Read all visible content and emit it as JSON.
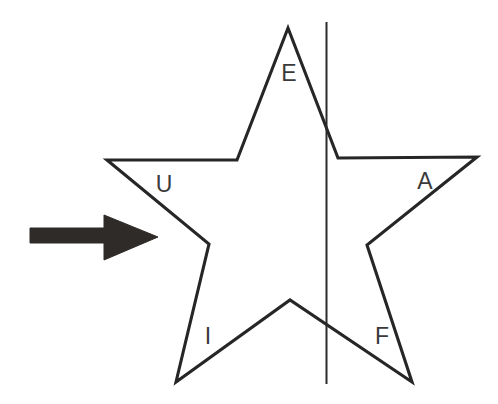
{
  "figure": {
    "background_color": "#ffffff",
    "width": 498,
    "height": 404
  },
  "star": {
    "name": "five-pointed-star",
    "stroke_color": "#262626",
    "fill_color": "#ffffff",
    "stroke_width": 3.1,
    "points_path": "288,28 338,158 477,157 367,245 412,382 290,300 176,382 209,244 107,160 237,160",
    "outer_vertices": [
      {
        "name": "top-point",
        "x": 288,
        "y": 28
      },
      {
        "name": "right-point",
        "x": 477,
        "y": 157
      },
      {
        "name": "bottom-right-point",
        "x": 412,
        "y": 382
      },
      {
        "name": "bottom-left-point",
        "x": 176,
        "y": 382
      },
      {
        "name": "left-point",
        "x": 107,
        "y": 160
      }
    ],
    "inner_vertices": [
      {
        "name": "upper-right-notch",
        "x": 338,
        "y": 158
      },
      {
        "name": "right-notch",
        "x": 367,
        "y": 245
      },
      {
        "name": "bottom-notch",
        "x": 290,
        "y": 300
      },
      {
        "name": "left-notch",
        "x": 209,
        "y": 244
      },
      {
        "name": "upper-left-notch",
        "x": 237,
        "y": 160
      }
    ]
  },
  "labels": [
    {
      "id": "label-e",
      "text": "E",
      "x": 289,
      "y": 81,
      "name": "star-label-e"
    },
    {
      "id": "label-u",
      "text": "U",
      "x": 164,
      "y": 192,
      "name": "star-label-u"
    },
    {
      "id": "label-a",
      "text": "A",
      "x": 425,
      "y": 189,
      "name": "star-label-a"
    },
    {
      "id": "label-i",
      "text": "I",
      "x": 208,
      "y": 344,
      "name": "star-label-i"
    },
    {
      "id": "label-f",
      "text": "F",
      "x": 382,
      "y": 344,
      "name": "star-label-f"
    }
  ],
  "mirror_line": {
    "name": "vertical-mirror-line",
    "x": 326.5,
    "y_top": 22,
    "y_bottom": 384,
    "color": "#2b2b2b",
    "width": 2.0
  },
  "arrow": {
    "name": "incoming-arrow",
    "direction": "right",
    "color": "#2e2b29",
    "shaft": {
      "x1": 30,
      "y1": 228,
      "x2": 108,
      "y2": 243
    },
    "head": {
      "x_base": 104,
      "x_tip": 158,
      "y_top": 215,
      "y_bottom": 260,
      "y_tip": 237
    },
    "path": "30,228 104,228 104,215 158,237 104,260 104,243 30,243"
  }
}
